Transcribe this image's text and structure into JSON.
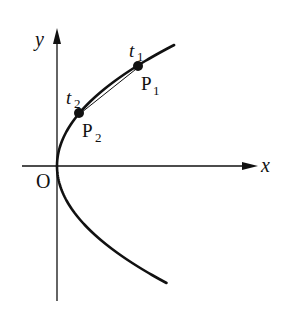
{
  "diagram": {
    "type": "parametric-curve-chord",
    "colors": {
      "ink": "#111111",
      "background": "#ffffff"
    },
    "axes": {
      "origin": {
        "x": 57,
        "y": 166
      },
      "x_axis": {
        "from": 22,
        "to": 258,
        "label": "x"
      },
      "y_axis": {
        "from": 301,
        "to": 28,
        "label": "y"
      },
      "origin_label": "O"
    },
    "curve": {
      "shape": "parabola opening right",
      "vertex": {
        "x": 57,
        "y": 166
      },
      "k": 0.008,
      "y_start": 45,
      "y_end": 284
    },
    "points": [
      {
        "name": "P1",
        "letter": "P",
        "sub": "1",
        "param_letter": "t",
        "param_sub": "1",
        "x": 138,
        "y": 66
      },
      {
        "name": "P2",
        "letter": "P",
        "sub": "2",
        "param_letter": "t",
        "param_sub": "2",
        "x": 79,
        "y": 113
      }
    ],
    "chord": {
      "from": "P1",
      "to": "P2"
    }
  }
}
